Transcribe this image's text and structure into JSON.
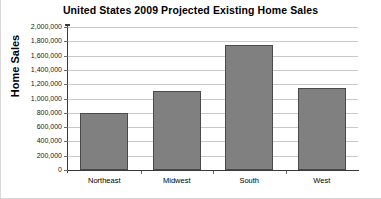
{
  "chart_data": {
    "type": "bar",
    "title": "United States 2009 Projected Existing Home Sales",
    "xlabel": "",
    "ylabel": "Home Sales",
    "categories": [
      "Northeast",
      "Midwest",
      "South",
      "West"
    ],
    "values": [
      800000,
      1100000,
      1750000,
      1150000
    ],
    "ylim": [
      0,
      2000000
    ],
    "ytick_values": [
      0,
      200000,
      400000,
      600000,
      800000,
      1000000,
      1200000,
      1400000,
      1600000,
      1800000,
      2000000
    ],
    "ytick_labels": [
      "0",
      "200,000",
      "400,000",
      "600,000",
      "800,000",
      "1,000,000",
      "1,200,000",
      "1,400,000",
      "1,600,000",
      "1,800,000",
      "2,000,000"
    ],
    "grid": true,
    "legend": false,
    "bar_color": "#808080",
    "bar_border_color": "#4a4a4a",
    "gridline_color": "#c9c9c9",
    "axis_color": "#3a3a3a",
    "background_color": "#ffffff"
  }
}
